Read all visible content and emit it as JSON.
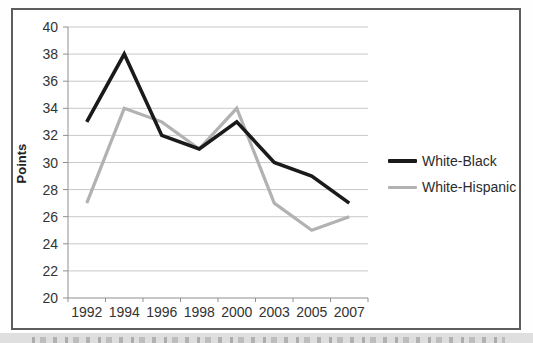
{
  "figure": {
    "ylabel": "Points",
    "colors": {
      "grid": "#c9c9c9",
      "axis": "#8f8f8f",
      "tick_text": "#333333",
      "frame_border": "#5e5e5e",
      "caption_strip_bg": "#dfdfdf"
    }
  },
  "chart_data": {
    "type": "line",
    "title": "",
    "xlabel": "",
    "ylabel": "Points",
    "categories": [
      "1992",
      "1994",
      "1996",
      "1998",
      "2000",
      "2003",
      "2005",
      "2007"
    ],
    "series": [
      {
        "name": "White-Black",
        "color": "#1a1a1a",
        "values": [
          33,
          38,
          32,
          31,
          33,
          30,
          29,
          27
        ]
      },
      {
        "name": "White-Hispanic",
        "color": "#b2b2b2",
        "values": [
          27,
          34,
          33,
          31,
          34,
          27,
          25,
          26
        ]
      }
    ],
    "ylim": [
      20,
      40
    ],
    "ytick_values": [
      20,
      22,
      24,
      26,
      28,
      30,
      32,
      34,
      36,
      38,
      40
    ],
    "grid": true,
    "legend_position": "right-of-plot"
  }
}
